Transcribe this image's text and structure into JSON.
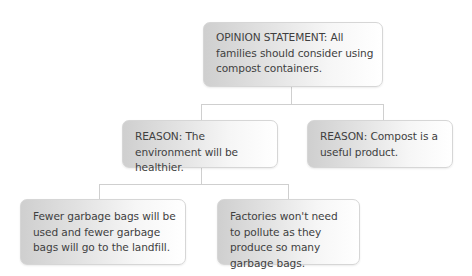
{
  "diagram": {
    "type": "tree",
    "root": {
      "text": "OPINION STATEMENT: All families should consider using compost containers."
    },
    "reasons": [
      {
        "text": "REASON: The environment will be healthier.",
        "details": [
          "Fewer garbage bags will be used and fewer garbage bags will go to the landfill.",
          "Factories won't need to pollute as they produce so many garbage bags."
        ]
      },
      {
        "text": "REASON: Compost is a useful product.",
        "details": []
      }
    ]
  },
  "colors": {
    "text": "#3f3f3f",
    "box_gradient_start": "#cfcfcf",
    "box_gradient_end": "#ffffff",
    "connector": "#cfcfcf"
  }
}
